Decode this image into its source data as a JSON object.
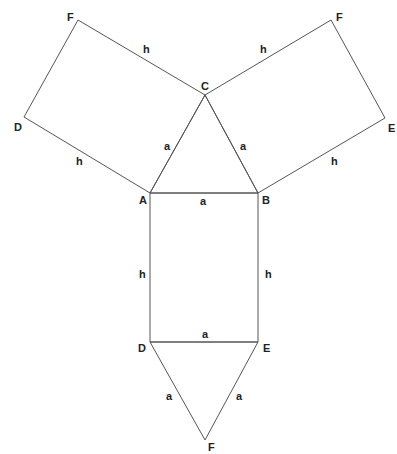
{
  "diagram": {
    "stroke_color": "#555555",
    "text_color": "#222222",
    "vertices": {
      "A": {
        "label": "A",
        "x": 150,
        "y": 193
      },
      "B": {
        "label": "B",
        "x": 258,
        "y": 193
      },
      "C": {
        "label": "C",
        "x": 205,
        "y": 95
      },
      "D_left": {
        "label": "D",
        "x": 24,
        "y": 117
      },
      "F_left": {
        "label": "F",
        "x": 78,
        "y": 20
      },
      "F_right": {
        "label": "F",
        "x": 331,
        "y": 20
      },
      "E_right": {
        "label": "E",
        "x": 385,
        "y": 118
      },
      "D_bottom": {
        "label": "D",
        "x": 150,
        "y": 342
      },
      "E_bottom": {
        "label": "E",
        "x": 258,
        "y": 342
      },
      "F_bottom": {
        "label": "F",
        "x": 205,
        "y": 440
      }
    },
    "edge_labels": {
      "left_rect_top": "h",
      "left_rect_bottom": "h",
      "right_rect_top": "h",
      "right_rect_bottom": "h",
      "triangle_left": "a",
      "triangle_right": "a",
      "ab": "a",
      "center_left": "h",
      "center_right": "h",
      "de": "a",
      "bottom_left": "a",
      "bottom_right": "a"
    },
    "faces": [
      {
        "name": "top-triangle",
        "type": "triangle",
        "vertices": [
          "A",
          "B",
          "C"
        ]
      },
      {
        "name": "left-rectangle",
        "type": "rectangle",
        "vertices": [
          "A",
          "C",
          "F_left",
          "D_left"
        ]
      },
      {
        "name": "right-rectangle",
        "type": "rectangle",
        "vertices": [
          "C",
          "B",
          "E_right",
          "F_right"
        ]
      },
      {
        "name": "center-rectangle",
        "type": "rectangle",
        "vertices": [
          "A",
          "B",
          "E_bottom",
          "D_bottom"
        ]
      },
      {
        "name": "bottom-triangle",
        "type": "triangle",
        "vertices": [
          "D_bottom",
          "E_bottom",
          "F_bottom"
        ]
      }
    ]
  }
}
